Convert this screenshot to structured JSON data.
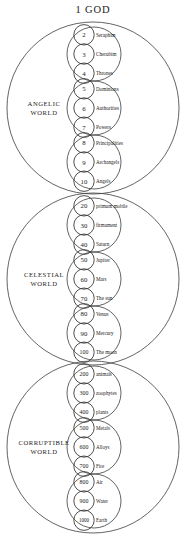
{
  "title": "1 GOD",
  "worlds": [
    {
      "name": "ANGELIC WORLD",
      "label_line1": "ANGELIC",
      "label_line2": "WORLD",
      "groups": [
        {
          "ranks": [
            {
              "number": "2",
              "label": "Seraphim"
            },
            {
              "number": "3",
              "label": "Cherubim"
            },
            {
              "number": "4",
              "label": "Thrones"
            }
          ]
        },
        {
          "ranks": [
            {
              "number": "5",
              "label": "Dominions"
            },
            {
              "number": "6",
              "label": "Authorities"
            },
            {
              "number": "7",
              "label": "Powers"
            }
          ]
        },
        {
          "ranks": [
            {
              "number": "8",
              "label": "Principalities"
            },
            {
              "number": "9",
              "label": "Archangels"
            },
            {
              "number": "10",
              "label": "Angels"
            }
          ]
        }
      ]
    },
    {
      "name": "CELESTIAL WORLD",
      "label_line1": "CELESTIAL",
      "label_line2": "WORLD",
      "groups": [
        {
          "ranks": [
            {
              "number": "20",
              "label": "primum mobile"
            },
            {
              "number": "30",
              "label": "firmament"
            },
            {
              "number": "40",
              "label": "Saturn"
            }
          ]
        },
        {
          "ranks": [
            {
              "number": "50",
              "label": "Jupiter"
            },
            {
              "number": "60",
              "label": "Mars"
            },
            {
              "number": "70",
              "label": "The sun"
            }
          ]
        },
        {
          "ranks": [
            {
              "number": "80",
              "label": "Venus"
            },
            {
              "number": "90",
              "label": "Mercury"
            },
            {
              "number": "100",
              "label": "The moon"
            }
          ]
        }
      ]
    },
    {
      "name": "CORRUPTIBLE WORLD",
      "label_line1": "CORRUPTIBLE",
      "label_line2": "WORLD",
      "groups": [
        {
          "ranks": [
            {
              "number": "200",
              "label": "animals"
            },
            {
              "number": "300",
              "label": "zoophytes"
            },
            {
              "number": "400",
              "label": "plants"
            }
          ]
        },
        {
          "ranks": [
            {
              "number": "500",
              "label": "Metals"
            },
            {
              "number": "600",
              "label": "Alloys"
            },
            {
              "number": "700",
              "label": "Fire"
            }
          ]
        },
        {
          "ranks": [
            {
              "number": "800",
              "label": "Air"
            },
            {
              "number": "900",
              "label": "Water"
            },
            {
              "number": "1000",
              "label": "Earth"
            }
          ]
        }
      ]
    }
  ],
  "colors": {
    "stroke": "#3c3c3c",
    "text": "#1a1a1a",
    "background": "#ffffff"
  },
  "geometry": {
    "outer_centers_y": [
      108,
      279,
      447
    ],
    "outer_radius": 86,
    "outer_center_x": 93,
    "medium_radius": 27,
    "small_radius": 10.2,
    "small_center_x": 84,
    "small_spacing": 19.2,
    "label_x": 96
  }
}
